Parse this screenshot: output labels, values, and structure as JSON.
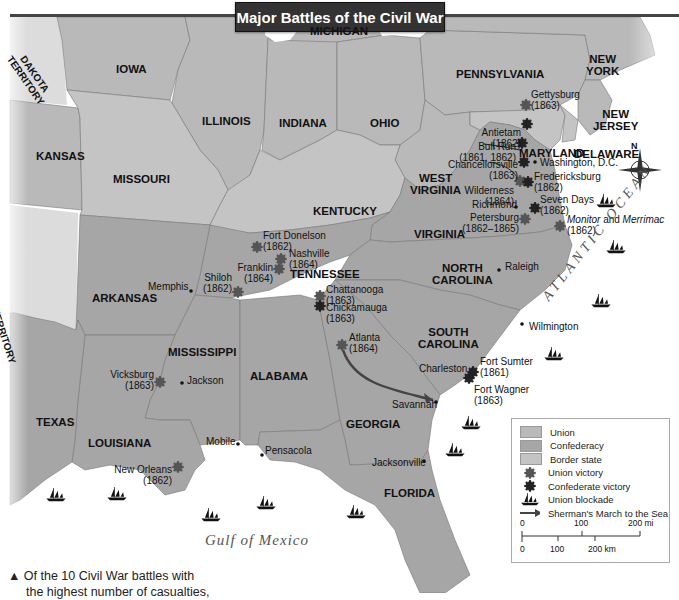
{
  "title": "Major Battles of the Civil War",
  "colors": {
    "union": "#b9b9b9",
    "confederacy": "#a6a6a6",
    "border_state": "#c4c4c4",
    "territory": "#dcdcdc",
    "water": "#ffffff",
    "union_victory": "#555555",
    "confederate_victory": "#222222",
    "march_arrow": "#444444"
  },
  "states": [
    {
      "name": "IOWA",
      "x": 116,
      "y": 63
    },
    {
      "name": "MICHIGAN",
      "x": 310,
      "y": 25
    },
    {
      "name": "ILLINOIS",
      "x": 202,
      "y": 115
    },
    {
      "name": "INDIANA",
      "x": 279,
      "y": 117
    },
    {
      "name": "OHIO",
      "x": 370,
      "y": 117
    },
    {
      "name": "PENNSYLVANIA",
      "x": 456,
      "y": 68
    },
    {
      "name": "NEW\nYORK",
      "x": 586,
      "y": 53
    },
    {
      "name": "NEW\nJERSEY",
      "x": 593,
      "y": 108
    },
    {
      "name": "MARYLAND",
      "x": 519,
      "y": 147
    },
    {
      "name": "DELAWARE",
      "x": 574,
      "y": 148
    },
    {
      "name": "KANSAS",
      "x": 36,
      "y": 150
    },
    {
      "name": "MISSOURI",
      "x": 113,
      "y": 173
    },
    {
      "name": "KENTUCKY",
      "x": 313,
      "y": 205
    },
    {
      "name": "WEST\nVIRGINIA",
      "x": 410,
      "y": 172
    },
    {
      "name": "VIRGINIA",
      "x": 414,
      "y": 228
    },
    {
      "name": "TENNESSEE",
      "x": 290,
      "y": 268
    },
    {
      "name": "NORTH\nCAROLINA",
      "x": 432,
      "y": 262
    },
    {
      "name": "ARKANSAS",
      "x": 92,
      "y": 292
    },
    {
      "name": "SOUTH\nCAROLINA",
      "x": 418,
      "y": 326
    },
    {
      "name": "MISSISSIPPI",
      "x": 168,
      "y": 346
    },
    {
      "name": "ALABAMA",
      "x": 250,
      "y": 370
    },
    {
      "name": "GEORGIA",
      "x": 346,
      "y": 418
    },
    {
      "name": "TEXAS",
      "x": 36,
      "y": 416
    },
    {
      "name": "LOUISIANA",
      "x": 88,
      "y": 437
    },
    {
      "name": "FLORDA_PLACEHOLDER",
      "x": 0,
      "y": 0
    }
  ],
  "territories": [
    {
      "name": "DAKOTA\nTERRITORY",
      "x": 22,
      "y": 48,
      "rotate": 55
    },
    {
      "name": "INDIAN TERRITORY",
      "x": -12,
      "y": 272,
      "rotate": 72
    }
  ],
  "florida": {
    "name": "FLORIDA",
    "x": 384,
    "y": 487
  },
  "cities": [
    {
      "name": "Washington, D.C.",
      "x": 540,
      "y": 158,
      "dot_x": 535,
      "dot_y": 162
    },
    {
      "name": "Richmond",
      "x": 472,
      "y": 200,
      "dot_x": 516,
      "dot_y": 207,
      "align": "right"
    },
    {
      "name": "Raleigh",
      "x": 505,
      "y": 262,
      "dot_x": 499,
      "dot_y": 270
    },
    {
      "name": "Memphis",
      "x": 148,
      "y": 282,
      "dot_x": 191,
      "dot_y": 291,
      "align": "right"
    },
    {
      "name": "Wilmington",
      "x": 529,
      "y": 322,
      "dot_x": 522,
      "dot_y": 324
    },
    {
      "name": "Jackson",
      "x": 187,
      "y": 376,
      "dot_x": 182,
      "dot_y": 383
    },
    {
      "name": "Charleston",
      "x": 419,
      "y": 364,
      "align": "right"
    },
    {
      "name": "Savannah",
      "x": 392,
      "y": 400,
      "dot_x": 436,
      "dot_y": 402,
      "align": "right"
    },
    {
      "name": "Mobile",
      "x": 206,
      "y": 437,
      "dot_x": 238,
      "dot_y": 444,
      "align": "right"
    },
    {
      "name": "Pensacola",
      "x": 265,
      "y": 446,
      "dot_x": 262,
      "dot_y": 455
    },
    {
      "name": "Jacksonville",
      "x": 372,
      "y": 458,
      "dot_x": 424,
      "dot_y": 461,
      "align": "right"
    }
  ],
  "battles": [
    {
      "name": "Gettysburg",
      "year": "(1863)",
      "x": 531,
      "y": 90,
      "ix": 526,
      "iy": 105,
      "victor": "union"
    },
    {
      "name": "Antietam",
      "year": "(1862)",
      "x": 476,
      "y": 128,
      "ix": 527,
      "iy": 124,
      "victor": "confederate",
      "align": "right"
    },
    {
      "name": "Bull Run",
      "year": "(1861, 1862)",
      "x": 444,
      "y": 142,
      "ix": 522,
      "iy": 143,
      "victor": "confederate",
      "align": "right"
    },
    {
      "name": "Chancellorsville",
      "year": "(1863)",
      "x": 425,
      "y": 160,
      "ix": 524,
      "iy": 162,
      "victor": "confederate",
      "align": "right"
    },
    {
      "name": "Wilderness",
      "year": "(1864)",
      "x": 460,
      "y": 186,
      "ix": 520,
      "iy": 181,
      "victor": "union",
      "align": "right"
    },
    {
      "name": "Fredericksburg",
      "year": "(1862)",
      "x": 534,
      "y": 172,
      "ix": 528,
      "iy": 182,
      "victor": "confederate"
    },
    {
      "name": "Seven Days",
      "year": "(1862)",
      "x": 540,
      "y": 195,
      "ix": 535,
      "iy": 208,
      "victor": "confederate"
    },
    {
      "name": "Petersburg",
      "year": "(1862–1865)",
      "x": 465,
      "y": 213,
      "ix": 525,
      "iy": 219,
      "victor": "union",
      "align": "right"
    },
    {
      "name": "Monitor and Merrimac",
      "year": "(1862)",
      "x": 567,
      "y": 215,
      "ix": 560,
      "iy": 226,
      "victor": "union",
      "italic_parts": [
        "Monitor",
        "Merrimac"
      ]
    },
    {
      "name": "Fort Donelson",
      "year": "(1862)",
      "x": 263,
      "y": 231,
      "ix": 257,
      "iy": 247,
      "victor": "union"
    },
    {
      "name": "Nashville",
      "year": "(1864)",
      "x": 289,
      "y": 249,
      "ix": 281,
      "iy": 259,
      "victor": "union"
    },
    {
      "name": "Franklin",
      "year": "(1864)",
      "x": 237,
      "y": 263,
      "ix": 279,
      "iy": 269,
      "victor": "union",
      "align": "right"
    },
    {
      "name": "Shiloh",
      "year": "(1862)",
      "x": 207,
      "y": 273,
      "ix": 238,
      "iy": 292,
      "victor": "union",
      "align": "right"
    },
    {
      "name": "Chattanooga",
      "year": "(1863)",
      "x": 326,
      "y": 285,
      "ix": 320,
      "iy": 296,
      "victor": "union"
    },
    {
      "name": "Chickamauga",
      "year": "(1863)",
      "x": 326,
      "y": 303,
      "ix": 320,
      "iy": 306,
      "victor": "confederate"
    },
    {
      "name": "Atlanta",
      "year": "(1864)",
      "x": 349,
      "y": 333,
      "ix": 342,
      "iy": 345,
      "victor": "union"
    },
    {
      "name": "Fort Sumter",
      "year": "(1861)",
      "x": 480,
      "y": 357,
      "ix": 473,
      "iy": 372,
      "victor": "confederate"
    },
    {
      "name": "Fort Wagner",
      "year": "(1863)",
      "x": 474,
      "y": 385,
      "ix": 469,
      "iy": 378,
      "victor": "confederate"
    },
    {
      "name": "Vicksburg",
      "year": "(1863)",
      "x": 110,
      "y": 370,
      "ix": 160,
      "iy": 382,
      "victor": "union",
      "align": "right"
    },
    {
      "name": "New Orleans",
      "year": "(1862)",
      "x": 116,
      "y": 465,
      "ix": 178,
      "iy": 467,
      "victor": "union",
      "align": "right"
    }
  ],
  "ships": [
    {
      "x": 595,
      "y": 194
    },
    {
      "x": 605,
      "y": 240
    },
    {
      "x": 590,
      "y": 294
    },
    {
      "x": 543,
      "y": 347
    },
    {
      "x": 460,
      "y": 416
    },
    {
      "x": 444,
      "y": 443
    },
    {
      "x": 345,
      "y": 505
    },
    {
      "x": 106,
      "y": 487
    },
    {
      "x": 200,
      "y": 508
    },
    {
      "x": 255,
      "y": 496
    },
    {
      "x": 45,
      "y": 488
    }
  ],
  "oceans": {
    "atlantic": "ATLANTIC OCEAN",
    "gulf": "Gulf of Mexico"
  },
  "compass": {
    "label": "N"
  },
  "legend": {
    "items": [
      {
        "type": "swatch",
        "label": "Union",
        "color": "#b9b9b9"
      },
      {
        "type": "swatch",
        "label": "Confederacy",
        "color": "#a6a6a6"
      },
      {
        "type": "swatch",
        "label": "Border state",
        "color": "#c4c4c4"
      },
      {
        "type": "union-victory",
        "label": "Union victory"
      },
      {
        "type": "confederate-victory",
        "label": "Confederate victory"
      },
      {
        "type": "ship",
        "label": "Union blockade"
      },
      {
        "type": "arrow",
        "label": "Sherman's March to the Sea"
      }
    ],
    "scale": {
      "mi_ticks": [
        "0",
        "100",
        "200 mi"
      ],
      "km_ticks": [
        "0",
        "100",
        "200 km"
      ]
    }
  },
  "caption": {
    "line1": "▲  Of the 10 Civil War battles with",
    "line2": "the highest number of casualties,"
  }
}
